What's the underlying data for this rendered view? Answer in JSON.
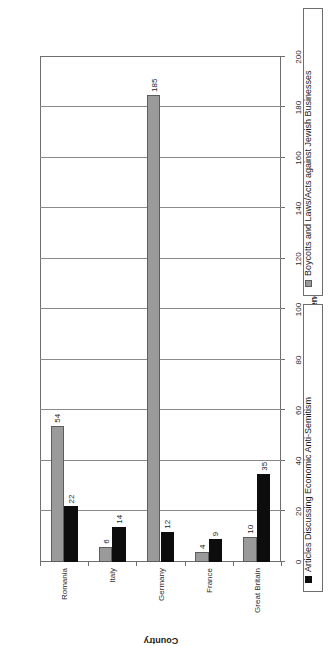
{
  "chart_data": {
    "type": "bar",
    "title": "",
    "subtitle": "",
    "orientation": "vertical-bars-rotated-page",
    "xlabel": "Country",
    "ylabel": "Frequency",
    "categories": [
      "Great Britain",
      "France",
      "Germany",
      "Italy",
      "Romania"
    ],
    "series": [
      {
        "name": "Articles Discussing Economic Anti-Semitism",
        "color": "#0d0d0d",
        "values": [
          35,
          9,
          12,
          14,
          22
        ]
      },
      {
        "name": "Boycotts and Laws/Acts against Jewish Businesses",
        "color": "#9a9a9a",
        "values": [
          10,
          4,
          185,
          6,
          54
        ]
      }
    ],
    "ylim": [
      0,
      200
    ],
    "ytick_labels": [
      "0",
      "20",
      "40",
      "60",
      "80",
      "100",
      "120",
      "140",
      "160",
      "180",
      "200"
    ],
    "ytick_values": [
      0,
      20,
      40,
      60,
      80,
      100,
      120,
      140,
      160,
      180,
      200
    ],
    "grid": true,
    "grid_axis": "value",
    "legend_position": "right-boxed-strips",
    "data_labels": true
  },
  "axes": {
    "value_axis_title": "Frequency",
    "category_axis_title": "Country"
  },
  "legend": {
    "entries": [
      {
        "label": "Boycotts and Laws/Acts against Jewish Businesses",
        "swatch": "gray-square-icon",
        "series_index": 1
      },
      {
        "label": "Articles Discussing Economic Anti-Semitism",
        "swatch": "black-square-icon",
        "series_index": 0
      }
    ]
  },
  "colors": {
    "series_articles": "#0d0d0d",
    "series_boycotts": "#9a9a9a",
    "axis": "#6e6e6e",
    "grid": "#8a8a8a",
    "background": "#ffffff"
  }
}
